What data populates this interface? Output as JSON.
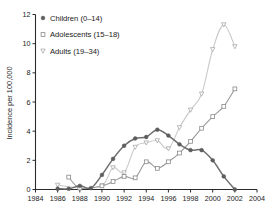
{
  "chart_data": {
    "type": "line",
    "title": "",
    "subtitle": "",
    "xlabel": "",
    "ylabel": "Incidence per 100,000",
    "xlim": [
      1984,
      2004
    ],
    "ylim": [
      0,
      12
    ],
    "ytick_step": 2,
    "xtick_step": 2,
    "grid": false,
    "legend_position": "top-left",
    "xticks": [
      "1984",
      "1986",
      "1988",
      "1990",
      "1992",
      "1994",
      "1996",
      "1998",
      "2000",
      "2002",
      "2004"
    ],
    "yticks": [
      "0",
      "2",
      "4",
      "6",
      "8",
      "10",
      "12"
    ],
    "series": [
      {
        "name": "Children (0–14)",
        "legend_label": "Children (0–14)",
        "marker": "filled-circle",
        "color": "#5d5d5d",
        "line_color": "#6e6e6e",
        "x": [
          1986,
          1987,
          1988,
          1989,
          1990,
          1991,
          1992,
          1993,
          1994,
          1995,
          1996,
          1997,
          1998,
          1999,
          2000,
          2001,
          2002
        ],
        "values": [
          0.05,
          0.05,
          0.25,
          0.1,
          1.0,
          2.1,
          3.0,
          3.5,
          3.6,
          4.1,
          3.7,
          3.1,
          2.7,
          2.7,
          2.0,
          0.9,
          0.0
        ]
      },
      {
        "name": "Adolescents (15–18)",
        "legend_label": "Adolescents (15–18)",
        "marker": "open-square",
        "color": "#8a8a8a",
        "line_color": "#9a9a9a",
        "x": [
          1987,
          1988,
          1990,
          1991,
          1992,
          1993,
          1994,
          1995,
          1996,
          1997,
          1998,
          1999,
          2000,
          2001,
          2002
        ],
        "values": [
          0.85,
          0.1,
          0.25,
          0.55,
          0.9,
          0.8,
          1.9,
          1.45,
          1.9,
          2.5,
          3.3,
          4.2,
          5.0,
          5.7,
          6.9
        ]
      },
      {
        "name": "Adults (19–34)",
        "legend_label": "Adults (19–34)",
        "marker": "open-triangle-down",
        "color": "#a8a8a8",
        "line_color": "#c8c8c8",
        "x": [
          1986,
          1988,
          1990,
          1991,
          1992,
          1993,
          1994,
          1995,
          1996,
          1997,
          1998,
          1999,
          2000,
          2001,
          2002
        ],
        "values": [
          0.3,
          0.1,
          0.25,
          1.5,
          1.15,
          2.9,
          3.2,
          3.35,
          2.8,
          4.25,
          5.45,
          6.55,
          9.6,
          11.3,
          9.8
        ]
      }
    ]
  }
}
